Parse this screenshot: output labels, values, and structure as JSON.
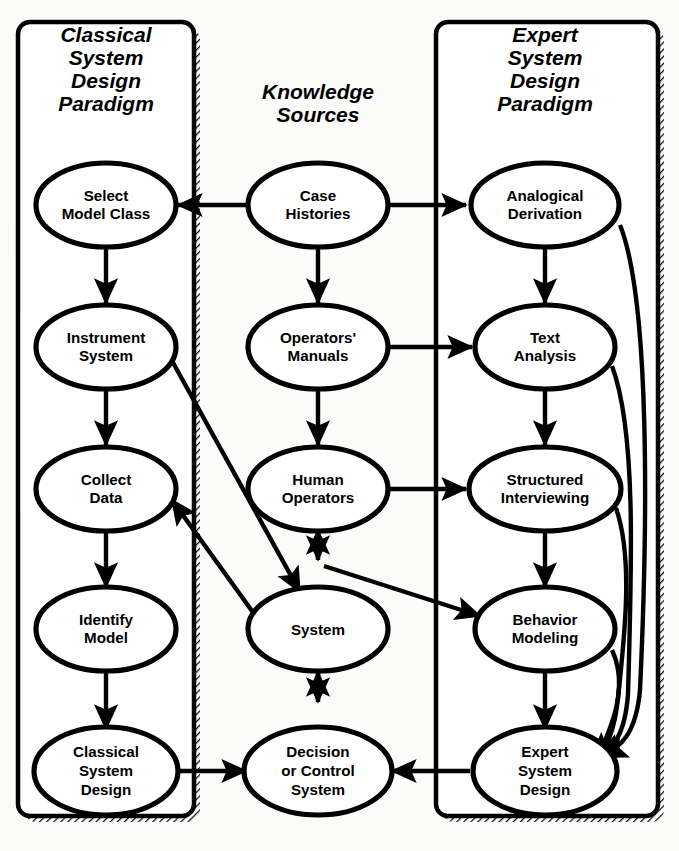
{
  "figure": {
    "background_color": "#fbfbf9",
    "line_color": "#000000"
  },
  "columns": [
    {
      "id": "classical",
      "header": [
        "Classical",
        "System",
        "Design",
        "Paradigm"
      ],
      "boxed": true
    },
    {
      "id": "knowledge",
      "header": [
        "Knowledge",
        "Sources"
      ],
      "boxed": false
    },
    {
      "id": "expert",
      "header": [
        "Expert",
        "System",
        "Design",
        "Paradigm"
      ],
      "boxed": true
    }
  ],
  "nodes": [
    {
      "id": "select-model-class",
      "column": "classical",
      "row": 1,
      "lines": [
        "Select",
        "Model Class"
      ]
    },
    {
      "id": "instrument-system",
      "column": "classical",
      "row": 2,
      "lines": [
        "Instrument",
        "System"
      ]
    },
    {
      "id": "collect-data",
      "column": "classical",
      "row": 3,
      "lines": [
        "Collect",
        "Data"
      ]
    },
    {
      "id": "identify-model",
      "column": "classical",
      "row": 4,
      "lines": [
        "Identify",
        "Model"
      ]
    },
    {
      "id": "classical-system-design",
      "column": "classical",
      "row": 5,
      "lines": [
        "Classical",
        "System",
        "Design"
      ]
    },
    {
      "id": "case-histories",
      "column": "knowledge",
      "row": 1,
      "lines": [
        "Case",
        "Histories"
      ]
    },
    {
      "id": "operators-manuals",
      "column": "knowledge",
      "row": 2,
      "lines": [
        "Operators'",
        "Manuals"
      ]
    },
    {
      "id": "human-operators",
      "column": "knowledge",
      "row": 3,
      "lines": [
        "Human",
        "Operators"
      ]
    },
    {
      "id": "system",
      "column": "knowledge",
      "row": 4,
      "lines": [
        "System"
      ]
    },
    {
      "id": "decision-or-control-system",
      "column": "knowledge",
      "row": 5,
      "lines": [
        "Decision",
        "or Control",
        "System"
      ]
    },
    {
      "id": "analogical-derivation",
      "column": "expert",
      "row": 1,
      "lines": [
        "Analogical",
        "Derivation"
      ]
    },
    {
      "id": "text-analysis",
      "column": "expert",
      "row": 2,
      "lines": [
        "Text",
        "Analysis"
      ]
    },
    {
      "id": "structured-interviewing",
      "column": "expert",
      "row": 3,
      "lines": [
        "Structured",
        "Interviewing"
      ]
    },
    {
      "id": "behavior-modeling",
      "column": "expert",
      "row": 4,
      "lines": [
        "Behavior",
        "Modeling"
      ]
    },
    {
      "id": "expert-system-design",
      "column": "expert",
      "row": 5,
      "lines": [
        "Expert",
        "System",
        "Design"
      ]
    }
  ],
  "edges": [
    {
      "from": "case-histories",
      "to": "select-model-class",
      "kind": "straight",
      "direction": "one-way"
    },
    {
      "from": "case-histories",
      "to": "analogical-derivation",
      "kind": "straight",
      "direction": "one-way"
    },
    {
      "from": "operators-manuals",
      "to": "text-analysis",
      "kind": "straight",
      "direction": "one-way"
    },
    {
      "from": "human-operators",
      "to": "structured-interviewing",
      "kind": "straight",
      "direction": "one-way"
    },
    {
      "from": "select-model-class",
      "to": "instrument-system",
      "kind": "straight",
      "direction": "one-way"
    },
    {
      "from": "instrument-system",
      "to": "collect-data",
      "kind": "straight",
      "direction": "one-way"
    },
    {
      "from": "collect-data",
      "to": "identify-model",
      "kind": "straight",
      "direction": "one-way"
    },
    {
      "from": "identify-model",
      "to": "classical-system-design",
      "kind": "straight",
      "direction": "one-way"
    },
    {
      "from": "case-histories",
      "to": "operators-manuals",
      "kind": "straight",
      "direction": "one-way"
    },
    {
      "from": "operators-manuals",
      "to": "human-operators",
      "kind": "straight",
      "direction": "one-way"
    },
    {
      "from": "human-operators",
      "to": "system",
      "kind": "straight",
      "direction": "two-way"
    },
    {
      "from": "system",
      "to": "decision-or-control-system",
      "kind": "straight",
      "direction": "two-way"
    },
    {
      "from": "analogical-derivation",
      "to": "text-analysis",
      "kind": "straight",
      "direction": "one-way"
    },
    {
      "from": "text-analysis",
      "to": "structured-interviewing",
      "kind": "straight",
      "direction": "one-way"
    },
    {
      "from": "structured-interviewing",
      "to": "behavior-modeling",
      "kind": "straight",
      "direction": "one-way"
    },
    {
      "from": "behavior-modeling",
      "to": "expert-system-design",
      "kind": "straight",
      "direction": "one-way"
    },
    {
      "from": "instrument-system",
      "to": "system",
      "kind": "diagonal",
      "direction": "one-way"
    },
    {
      "from": "system",
      "to": "collect-data",
      "kind": "diagonal",
      "direction": "one-way"
    },
    {
      "from": "system",
      "to": "behavior-modeling",
      "kind": "diagonal",
      "direction": "one-way"
    },
    {
      "from": "classical-system-design",
      "to": "decision-or-control-system",
      "kind": "straight",
      "direction": "one-way"
    },
    {
      "from": "expert-system-design",
      "to": "decision-or-control-system",
      "kind": "straight",
      "direction": "one-way"
    },
    {
      "from": "analogical-derivation",
      "to": "expert-system-design",
      "kind": "curve",
      "direction": "one-way"
    },
    {
      "from": "text-analysis",
      "to": "expert-system-design",
      "kind": "curve",
      "direction": "one-way"
    },
    {
      "from": "structured-interviewing",
      "to": "expert-system-design",
      "kind": "curve",
      "direction": "one-way"
    },
    {
      "from": "behavior-modeling",
      "to": "expert-system-design",
      "kind": "curve",
      "direction": "one-way"
    }
  ]
}
